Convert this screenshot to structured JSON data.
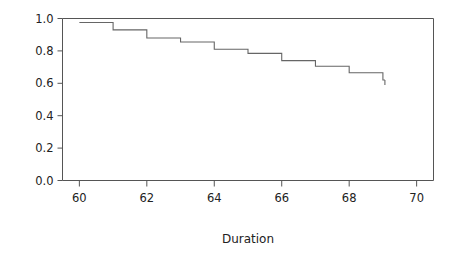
{
  "figure": {
    "background_color": "#ffffff",
    "line_color": "#666666",
    "axis_color": "#555555",
    "text_color": "#222222"
  },
  "chart_data": {
    "type": "line",
    "subtype": "step-post survival curve (Kaplan-Meier)",
    "title": "",
    "subtitle": "",
    "xlabel": "Duration",
    "ylabel": "",
    "grid": false,
    "legend": null,
    "xlim": [
      59.5,
      70.5
    ],
    "ylim": [
      0.0,
      1.0
    ],
    "xticks": [
      60,
      62,
      64,
      66,
      68,
      70
    ],
    "xticklabels": [
      "60",
      "62",
      "64",
      "66",
      "68",
      "70"
    ],
    "yticks": [
      0.0,
      0.2,
      0.4,
      0.6,
      0.8,
      1.0
    ],
    "yticklabels": [
      "0.0",
      "0.2",
      "0.4",
      "0.6",
      "0.8",
      "1.0"
    ],
    "x": [
      60,
      61,
      62,
      63,
      64,
      65,
      66,
      67,
      68,
      69
    ],
    "values": [
      0.975,
      0.93,
      0.88,
      0.855,
      0.81,
      0.785,
      0.74,
      0.705,
      0.665,
      0.62
    ],
    "series": [
      {
        "name": "survival",
        "x": [
          60,
          61,
          62,
          63,
          64,
          65,
          66,
          67,
          68,
          69
        ],
        "values": [
          0.975,
          0.93,
          0.88,
          0.855,
          0.81,
          0.785,
          0.74,
          0.705,
          0.665,
          0.62
        ]
      }
    ],
    "annotations": []
  }
}
